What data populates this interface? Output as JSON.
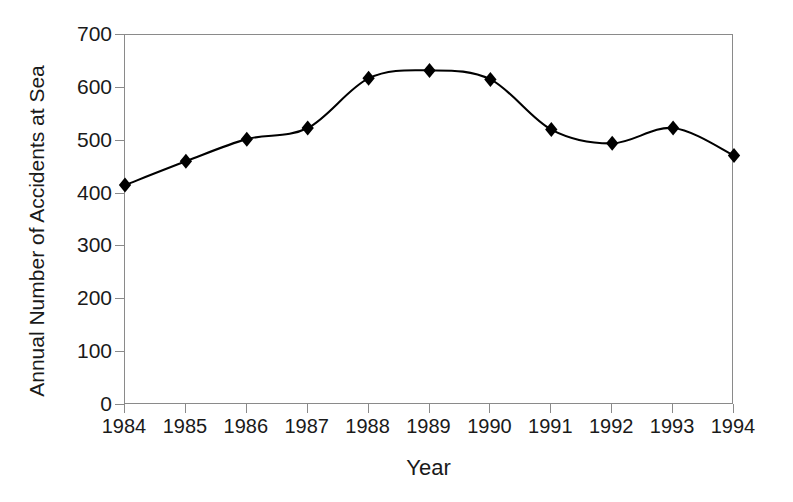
{
  "chart_data": {
    "type": "line",
    "title": "",
    "xlabel": "Year",
    "ylabel": "Annual Number of Accidents at Sea",
    "categories": [
      "1984",
      "1985",
      "1986",
      "1987",
      "1988",
      "1989",
      "1990",
      "1991",
      "1992",
      "1993",
      "1994"
    ],
    "x": [
      1984,
      1985,
      1986,
      1987,
      1988,
      1989,
      1990,
      1991,
      1992,
      1993,
      1994
    ],
    "values": [
      416,
      461,
      503,
      524,
      618,
      633,
      616,
      521,
      495,
      524,
      472
    ],
    "series": [
      {
        "name": "Annual Number of Accidents at Sea",
        "values": [
          416,
          461,
          503,
          524,
          618,
          633,
          616,
          521,
          495,
          524,
          472
        ]
      }
    ],
    "ylim": [
      0,
      700
    ],
    "ytick_values": [
      0,
      100,
      200,
      300,
      400,
      500,
      600,
      700
    ],
    "ytick_labels": [
      "0",
      "100",
      "200",
      "300",
      "400",
      "500",
      "600",
      "700"
    ],
    "xtick_labels": [
      "1984",
      "1985",
      "1986",
      "1987",
      "1988",
      "1989",
      "1990",
      "1991",
      "1992",
      "1993",
      "1994"
    ],
    "grid": false,
    "legend": null,
    "legend_position": "none",
    "marker": "diamond",
    "line_color": "#000000",
    "marker_color": "#000000",
    "axis_color": "#8a8a8a",
    "text_color": "#1a1a1a",
    "background_color": "#ffffff",
    "smoothing": "spline"
  }
}
